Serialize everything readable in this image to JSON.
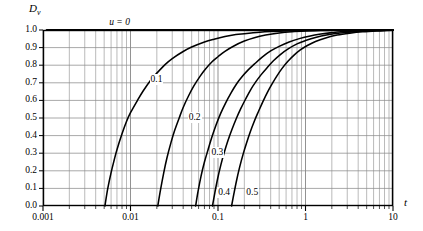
{
  "chart_data": {
    "type": "line",
    "title": "",
    "xlabel": "t",
    "ylabel": "Dv",
    "ylabel_base": "D",
    "ylabel_sub": "v",
    "xscale": "log",
    "yscale": "linear",
    "xlim": [
      0.001,
      10
    ],
    "ylim": [
      0.0,
      1.0
    ],
    "grid": true,
    "grid_minor": true,
    "legend_position": "inline-annotations",
    "xticks": [
      0.001,
      0.01,
      0.1,
      1,
      10
    ],
    "xtick_labels": [
      "0.001",
      "0.01",
      "0.1",
      "1",
      "10"
    ],
    "yticks": [
      0.0,
      0.1,
      0.2,
      0.3,
      0.4,
      0.5,
      0.6,
      0.7,
      0.8,
      0.9,
      1.0
    ],
    "ytick_labels": [
      "0.0",
      "0.1",
      "0.2",
      "0.3",
      "0.4",
      "0.5",
      "0.6",
      "0.7",
      "0.8",
      "0.9",
      "1.0"
    ],
    "line_color": "#000000",
    "grid_color": "#8c8c8c",
    "axis_color": "#000000",
    "series": [
      {
        "name": "u = 0",
        "label": "u = 0",
        "label_x": 0.0075,
        "label_y": 1.04,
        "x": [
          0.0011,
          0.0013,
          0.0016,
          0.002,
          0.0025,
          0.0032,
          0.004,
          0.005,
          0.0063,
          0.008,
          0.01,
          0.013,
          0.016,
          0.02,
          0.025,
          0.032,
          0.04,
          0.05,
          0.063,
          0.08,
          0.1,
          0.13,
          0.16,
          0.2,
          0.25,
          0.32,
          0.4,
          0.5,
          0.63,
          0.8,
          1.0,
          1.3,
          1.6,
          2.0,
          2.5,
          3.2,
          4.0,
          5.0,
          6.3,
          8.0,
          10.0
        ],
        "y": [
          1.0,
          1.0,
          1.0,
          1.0,
          1.0,
          1.0,
          1.0,
          1.0,
          1.0,
          1.0,
          1.0,
          1.0,
          1.0,
          1.0,
          1.0,
          1.0,
          1.0,
          1.0,
          1.0,
          1.0,
          1.0,
          1.0,
          1.0,
          1.0,
          1.0,
          1.0,
          1.0,
          1.0,
          1.0,
          1.0,
          1.0,
          1.0,
          1.0,
          1.0,
          1.0,
          1.0,
          1.0,
          1.0,
          1.0,
          1.0,
          1.0
        ]
      },
      {
        "name": "u = 0.1",
        "label": "0.1",
        "label_x": 0.0165,
        "label_y": 0.715,
        "x": [
          0.0051,
          0.0055,
          0.006,
          0.0065,
          0.007,
          0.008,
          0.009,
          0.01,
          0.012,
          0.014,
          0.017,
          0.02,
          0.025,
          0.03,
          0.04,
          0.05,
          0.07,
          0.09,
          0.12,
          0.16,
          0.2,
          0.3,
          0.4,
          0.6,
          0.8,
          1.0,
          1.5,
          2.0,
          3.0,
          5.0,
          7.0,
          10.0
        ],
        "y": [
          0.0,
          0.1,
          0.19,
          0.26,
          0.32,
          0.41,
          0.48,
          0.53,
          0.6,
          0.655,
          0.715,
          0.755,
          0.805,
          0.838,
          0.878,
          0.903,
          0.932,
          0.948,
          0.963,
          0.974,
          0.979,
          0.987,
          0.991,
          0.995,
          0.996,
          0.997,
          0.999,
          0.999,
          1.0,
          1.0,
          1.0,
          1.0
        ]
      },
      {
        "name": "u = 0.2",
        "label": "0.2",
        "label_x": 0.045,
        "label_y": 0.5,
        "x": [
          0.0205,
          0.022,
          0.024,
          0.026,
          0.029,
          0.032,
          0.036,
          0.04,
          0.046,
          0.053,
          0.062,
          0.072,
          0.085,
          0.1,
          0.12,
          0.15,
          0.2,
          0.26,
          0.35,
          0.5,
          0.7,
          1.0,
          1.5,
          2.0,
          3.0,
          5.0,
          7.0,
          10.0
        ],
        "y": [
          0.0,
          0.09,
          0.19,
          0.27,
          0.36,
          0.43,
          0.5,
          0.56,
          0.625,
          0.682,
          0.735,
          0.778,
          0.818,
          0.848,
          0.879,
          0.908,
          0.937,
          0.956,
          0.971,
          0.983,
          0.99,
          0.994,
          0.997,
          0.998,
          0.999,
          1.0,
          1.0,
          1.0
        ]
      },
      {
        "name": "u = 0.3",
        "label": "0.3",
        "label_x": 0.082,
        "label_y": 0.3,
        "x": [
          0.0555,
          0.059,
          0.064,
          0.07,
          0.077,
          0.085,
          0.095,
          0.107,
          0.122,
          0.14,
          0.162,
          0.19,
          0.22,
          0.26,
          0.32,
          0.4,
          0.5,
          0.65,
          0.85,
          1.1,
          1.5,
          2.0,
          3.0,
          5.0,
          7.0,
          10.0
        ],
        "y": [
          0.0,
          0.08,
          0.17,
          0.25,
          0.32,
          0.39,
          0.46,
          0.525,
          0.585,
          0.64,
          0.692,
          0.737,
          0.772,
          0.806,
          0.846,
          0.881,
          0.907,
          0.932,
          0.951,
          0.965,
          0.977,
          0.985,
          0.993,
          0.997,
          0.999,
          1.0
        ]
      },
      {
        "name": "u = 0.4",
        "label": "0.4",
        "label_x": 0.098,
        "label_y": 0.075,
        "x": [
          0.0865,
          0.092,
          0.099,
          0.108,
          0.118,
          0.13,
          0.145,
          0.162,
          0.182,
          0.207,
          0.235,
          0.27,
          0.31,
          0.36,
          0.43,
          0.52,
          0.64,
          0.8,
          1.0,
          1.3,
          1.8,
          2.5,
          4.0,
          6.0,
          8.0,
          10.0
        ],
        "y": [
          0.0,
          0.075,
          0.155,
          0.235,
          0.305,
          0.372,
          0.437,
          0.497,
          0.553,
          0.608,
          0.659,
          0.705,
          0.745,
          0.783,
          0.825,
          0.862,
          0.894,
          0.921,
          0.94,
          0.958,
          0.973,
          0.983,
          0.992,
          0.996,
          0.998,
          0.999
        ]
      },
      {
        "name": "u = 0.5",
        "label": "0.5",
        "label_x": 0.205,
        "label_y": 0.075,
        "x": [
          0.143,
          0.152,
          0.163,
          0.177,
          0.193,
          0.212,
          0.234,
          0.26,
          0.29,
          0.325,
          0.367,
          0.415,
          0.47,
          0.54,
          0.63,
          0.74,
          0.88,
          1.05,
          1.3,
          1.7,
          2.3,
          3.2,
          4.5,
          6.5,
          8.5,
          10.0
        ],
        "y": [
          0.0,
          0.07,
          0.145,
          0.222,
          0.292,
          0.358,
          0.422,
          0.482,
          0.537,
          0.592,
          0.646,
          0.694,
          0.738,
          0.782,
          0.822,
          0.857,
          0.888,
          0.912,
          0.935,
          0.955,
          0.971,
          0.982,
          0.99,
          0.995,
          0.997,
          0.998
        ]
      }
    ]
  },
  "figure": {
    "plot_left": 43,
    "plot_right": 393,
    "plot_top": 30,
    "plot_bottom": 206
  }
}
